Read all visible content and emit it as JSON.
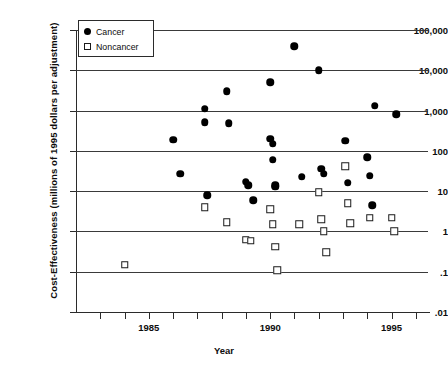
{
  "chart_data": {
    "type": "scatter",
    "title": "",
    "xlabel": "Year",
    "ylabel": "Cost-Effectiveness (millions of 1995 dollars per adjustment)",
    "yscale": "log",
    "ylim": [
      0.01,
      100000
    ],
    "xlim": [
      1982,
      1996.5
    ],
    "grid": true,
    "legend_position": "top-left",
    "ytick_labels": [
      "100,000",
      "10,000",
      "1,000",
      "100",
      "10",
      "1",
      ".1",
      ".01"
    ],
    "ytick_values": [
      100000,
      10000,
      1000,
      100,
      10,
      1,
      0.1,
      0.01
    ],
    "xtick_values": [
      1983,
      1984,
      1985,
      1986,
      1987,
      1988,
      1989,
      1990,
      1991,
      1992,
      1993,
      1994,
      1995,
      1996
    ],
    "xtick_labels": [
      "",
      "",
      "1985",
      "",
      "",
      "",
      "",
      "1990",
      "",
      "",
      "",
      "",
      "1995",
      ""
    ],
    "series": [
      {
        "name": "Cancer",
        "marker": "filled-circle",
        "color": "#000000",
        "points": [
          {
            "x": 1986.0,
            "y": 190
          },
          {
            "x": 1986.3,
            "y": 27
          },
          {
            "x": 1987.3,
            "y": 1100
          },
          {
            "x": 1987.3,
            "y": 510
          },
          {
            "x": 1987.4,
            "y": 8.0
          },
          {
            "x": 1988.2,
            "y": 3000
          },
          {
            "x": 1988.3,
            "y": 490
          },
          {
            "x": 1989.0,
            "y": 17
          },
          {
            "x": 1989.1,
            "y": 14
          },
          {
            "x": 1989.3,
            "y": 6.0
          },
          {
            "x": 1990.0,
            "y": 5000
          },
          {
            "x": 1990.0,
            "y": 200
          },
          {
            "x": 1990.1,
            "y": 150
          },
          {
            "x": 1990.1,
            "y": 60
          },
          {
            "x": 1990.2,
            "y": 14
          },
          {
            "x": 1990.2,
            "y": 13
          },
          {
            "x": 1991.0,
            "y": 40000
          },
          {
            "x": 1991.3,
            "y": 23
          },
          {
            "x": 1992.0,
            "y": 10000
          },
          {
            "x": 1992.1,
            "y": 36
          },
          {
            "x": 1992.2,
            "y": 27
          },
          {
            "x": 1993.1,
            "y": 180
          },
          {
            "x": 1993.2,
            "y": 16
          },
          {
            "x": 1994.0,
            "y": 70
          },
          {
            "x": 1994.1,
            "y": 24
          },
          {
            "x": 1994.2,
            "y": 4.5
          },
          {
            "x": 1994.3,
            "y": 1300
          },
          {
            "x": 1995.2,
            "y": 800
          }
        ]
      },
      {
        "name": "Noncancer",
        "marker": "open-square",
        "color": "#ffffff",
        "points": [
          {
            "x": 1984.0,
            "y": 0.15
          },
          {
            "x": 1987.3,
            "y": 4.0
          },
          {
            "x": 1988.2,
            "y": 1.7
          },
          {
            "x": 1989.0,
            "y": 0.62
          },
          {
            "x": 1989.2,
            "y": 0.58
          },
          {
            "x": 1990.0,
            "y": 3.6
          },
          {
            "x": 1990.1,
            "y": 1.5
          },
          {
            "x": 1990.2,
            "y": 0.42
          },
          {
            "x": 1990.3,
            "y": 0.11
          },
          {
            "x": 1991.2,
            "y": 1.5
          },
          {
            "x": 1992.0,
            "y": 9.5
          },
          {
            "x": 1992.1,
            "y": 2.0
          },
          {
            "x": 1992.2,
            "y": 1.0
          },
          {
            "x": 1992.3,
            "y": 0.3
          },
          {
            "x": 1993.1,
            "y": 42
          },
          {
            "x": 1993.2,
            "y": 5.0
          },
          {
            "x": 1993.3,
            "y": 1.6
          },
          {
            "x": 1994.1,
            "y": 2.2
          },
          {
            "x": 1995.0,
            "y": 2.2
          },
          {
            "x": 1995.1,
            "y": 1.0
          }
        ]
      }
    ]
  },
  "legend": {
    "items": [
      {
        "label": "Cancer",
        "marker": "filled-circle"
      },
      {
        "label": "Noncancer",
        "marker": "open-square"
      }
    ]
  }
}
